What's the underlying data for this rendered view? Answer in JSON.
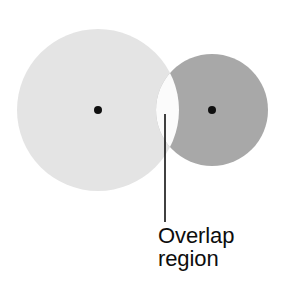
{
  "figure": {
    "background_color": "#ffffff"
  },
  "annotation": {
    "label_line_1": "Overlap",
    "label_line_2": "region",
    "text_color": "#0d0d0d",
    "leader_line_color": "#111111"
  },
  "chart_data": {
    "type": "diagram",
    "subtype": "venn-two-circle",
    "title": "Overlap region",
    "xlabel": "",
    "ylabel": "",
    "grid": false,
    "legend": "none",
    "units": "pixels",
    "canvas": {
      "width": 282,
      "height": 296
    },
    "shapes": [
      {
        "name": "left-circle",
        "role": "set-a",
        "center_x": 98,
        "center_y": 110,
        "radius": 81,
        "fill": "#e4e4e4",
        "stroke": "none",
        "label": ""
      },
      {
        "name": "right-circle",
        "role": "set-b",
        "center_x": 212,
        "center_y": 110,
        "radius": 56,
        "fill": "#a8a8a8",
        "stroke": "none",
        "label": ""
      },
      {
        "name": "overlap-lens",
        "role": "intersection",
        "fill": "#fbfbfb",
        "stroke": "none",
        "label": "Overlap region",
        "intersection_top_x": 160,
        "intersection_top_y": 53,
        "intersection_bottom_x": 160,
        "intersection_bottom_y": 167
      }
    ],
    "markers": [
      {
        "name": "left-center-dot",
        "x": 98,
        "y": 110,
        "radius": 4,
        "fill": "#101010"
      },
      {
        "name": "right-center-dot",
        "x": 212,
        "y": 110,
        "radius": 4,
        "fill": "#101010"
      }
    ],
    "annotations": [
      {
        "name": "overlap-callout",
        "text": "Overlap region",
        "leader_x1": 165,
        "leader_y1": 114,
        "leader_x2": 165,
        "leader_y2": 222,
        "text_x": 158,
        "text_y": 224
      }
    ]
  }
}
